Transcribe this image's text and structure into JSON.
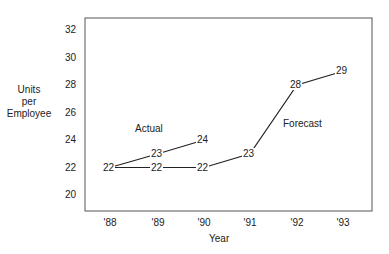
{
  "chart_data": {
    "type": "line",
    "title": "",
    "xlabel": "Year",
    "ylabel": "Units per Employee",
    "ylabel_lines": [
      "Units",
      "per",
      "Employee"
    ],
    "categories": [
      "'88",
      "'89",
      "'90",
      "'91",
      "'92",
      "'93"
    ],
    "yticks": [
      20,
      22,
      24,
      26,
      28,
      30,
      32
    ],
    "ylim": [
      19,
      33
    ],
    "grid": false,
    "series": [
      {
        "name": "Actual",
        "x": [
          "'88",
          "'89",
          "'90"
        ],
        "values": [
          22,
          23,
          24
        ]
      },
      {
        "name": "Forecast",
        "x": [
          "'88",
          "'89",
          "'90",
          "'91",
          "'92",
          "'93"
        ],
        "values": [
          22,
          22,
          22,
          23,
          28,
          29
        ]
      }
    ],
    "annotations": [
      {
        "text": "Actual",
        "near": "'89",
        "value": 25.5
      },
      {
        "text": "Forecast",
        "near": "'92",
        "value": 25
      }
    ]
  }
}
